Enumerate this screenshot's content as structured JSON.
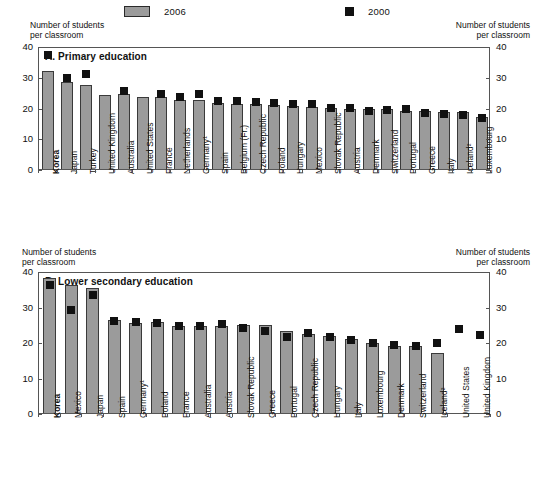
{
  "legend": {
    "bar_label": "2006",
    "marker_label": "2000",
    "bar_icon": "grey-bar-swatch",
    "marker_icon": "black-square-swatch"
  },
  "axis_caption": "Number of students\nper classroom",
  "chart_data": [
    {
      "type": "bar",
      "panel": "A",
      "title": "A. Primary education",
      "xlabel": "",
      "ylabel": "Number of students per classroom",
      "ylim": [
        0,
        40
      ],
      "yticks": [
        0,
        10,
        20,
        30,
        40
      ],
      "grid": false,
      "legend_position": "top",
      "categories": [
        "Korea",
        "Japan",
        "Turkey",
        "United Kingdom",
        "Australia",
        "United States",
        "France",
        "Netherlands",
        "Germany¹",
        "Spain",
        "Belgium (Fr.)",
        "Czech Republic",
        "Poland",
        "Hungary",
        "Mexico",
        "Slovak Republic",
        "Austria",
        "Denmark",
        "Switzerland",
        "Portugal",
        "Greece",
        "Italy",
        "Iceland²",
        "Luxembourg"
      ],
      "highlight_category": "Korea",
      "series": [
        {
          "name": "2006",
          "render": "bar",
          "values": [
            32.0,
            28.2,
            27.2,
            24.2,
            24.3,
            23.4,
            23.4,
            22.6,
            22.4,
            21.5,
            21.3,
            21.0,
            20.7,
            20.6,
            20.3,
            19.7,
            19.6,
            19.4,
            19.4,
            19.0,
            18.8,
            18.4,
            18.6,
            17.0
          ]
        },
        {
          "name": "2000",
          "render": "marker",
          "values": [
            37.0,
            29.5,
            31.0,
            null,
            25.5,
            null,
            24.5,
            23.3,
            24.4,
            22.2,
            22.0,
            21.8,
            21.5,
            21.2,
            21.0,
            20.0,
            19.8,
            19.0,
            19.3,
            19.5,
            18.3,
            17.8,
            17.6,
            16.5
          ]
        }
      ]
    },
    {
      "type": "bar",
      "panel": "B",
      "title": "B. Lower secondary education",
      "xlabel": "",
      "ylabel": "Number of students per classroom",
      "ylim": [
        0,
        40
      ],
      "yticks": [
        0,
        10,
        20,
        30,
        40
      ],
      "grid": false,
      "legend_position": "top",
      "categories": [
        "Korea",
        "Mexico",
        "Japan",
        "Spain",
        "Germany¹",
        "Poland",
        "France",
        "Australia",
        "Austria",
        "Slovak Republic",
        "Greece",
        "Portugal",
        "Czech Republic",
        "Hungary",
        "Italy",
        "Luxembourg",
        "Denmark",
        "Switzerland",
        "Iceland²",
        "United States",
        "United Kingdom"
      ],
      "highlight_category": "Korea",
      "series": [
        {
          "name": "2006",
          "render": "bar",
          "values": [
            38.0,
            36.0,
            35.2,
            26.2,
            25.4,
            25.5,
            24.6,
            24.6,
            24.6,
            24.8,
            24.8,
            23.2,
            22.3,
            21.6,
            20.8,
            19.6,
            19.0,
            19.0,
            17.0,
            null,
            null
          ]
        },
        {
          "name": "2000",
          "render": "marker",
          "values": [
            36.2,
            29.0,
            33.2,
            26.0,
            25.5,
            25.4,
            24.5,
            24.6,
            25.0,
            24.0,
            23.0,
            21.4,
            22.4,
            21.5,
            20.6,
            19.6,
            19.2,
            19.0,
            19.6,
            23.8,
            22.0
          ]
        }
      ]
    }
  ]
}
